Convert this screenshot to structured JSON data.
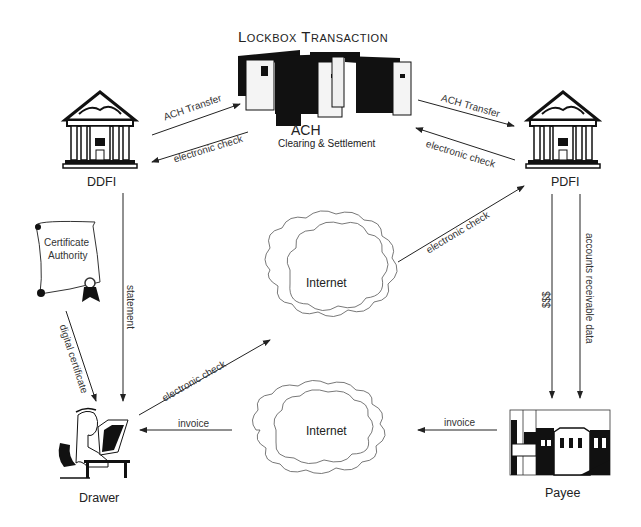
{
  "title": "Lockbox Transaction",
  "nodes": {
    "ach": {
      "label": "ACH",
      "sublabel": "Clearing & Settlement"
    },
    "ddfi": {
      "label": "DDFI"
    },
    "pdfi": {
      "label": "PDFI"
    },
    "certificate_authority": {
      "label_line1": "Certificate",
      "label_line2": "Authority"
    },
    "internet_top": {
      "label": "Internet"
    },
    "internet_bottom": {
      "label": "Internet"
    },
    "drawer": {
      "label": "Drawer"
    },
    "payee": {
      "label": "Payee"
    }
  },
  "edges": [
    {
      "id": "ddfi-to-ach",
      "label": "ACH Transfer"
    },
    {
      "id": "ach-to-ddfi",
      "label": "electronic check"
    },
    {
      "id": "ach-to-pdfi",
      "label": "ACH Transfer"
    },
    {
      "id": "pdfi-to-ach",
      "label": "electronic check"
    },
    {
      "id": "ddfi-to-drawer",
      "label": "statement"
    },
    {
      "id": "ca-to-drawer",
      "label": "digital certificate"
    },
    {
      "id": "drawer-to-internet",
      "label": "electronic check"
    },
    {
      "id": "internet-to-pdfi",
      "label": "electronic check"
    },
    {
      "id": "pdfi-to-payee-money",
      "label": "$$$"
    },
    {
      "id": "pdfi-to-payee-ar",
      "label": "accounts receivable data"
    },
    {
      "id": "payee-to-internet",
      "label": "invoice"
    },
    {
      "id": "internet-to-drawer",
      "label": "invoice"
    }
  ]
}
